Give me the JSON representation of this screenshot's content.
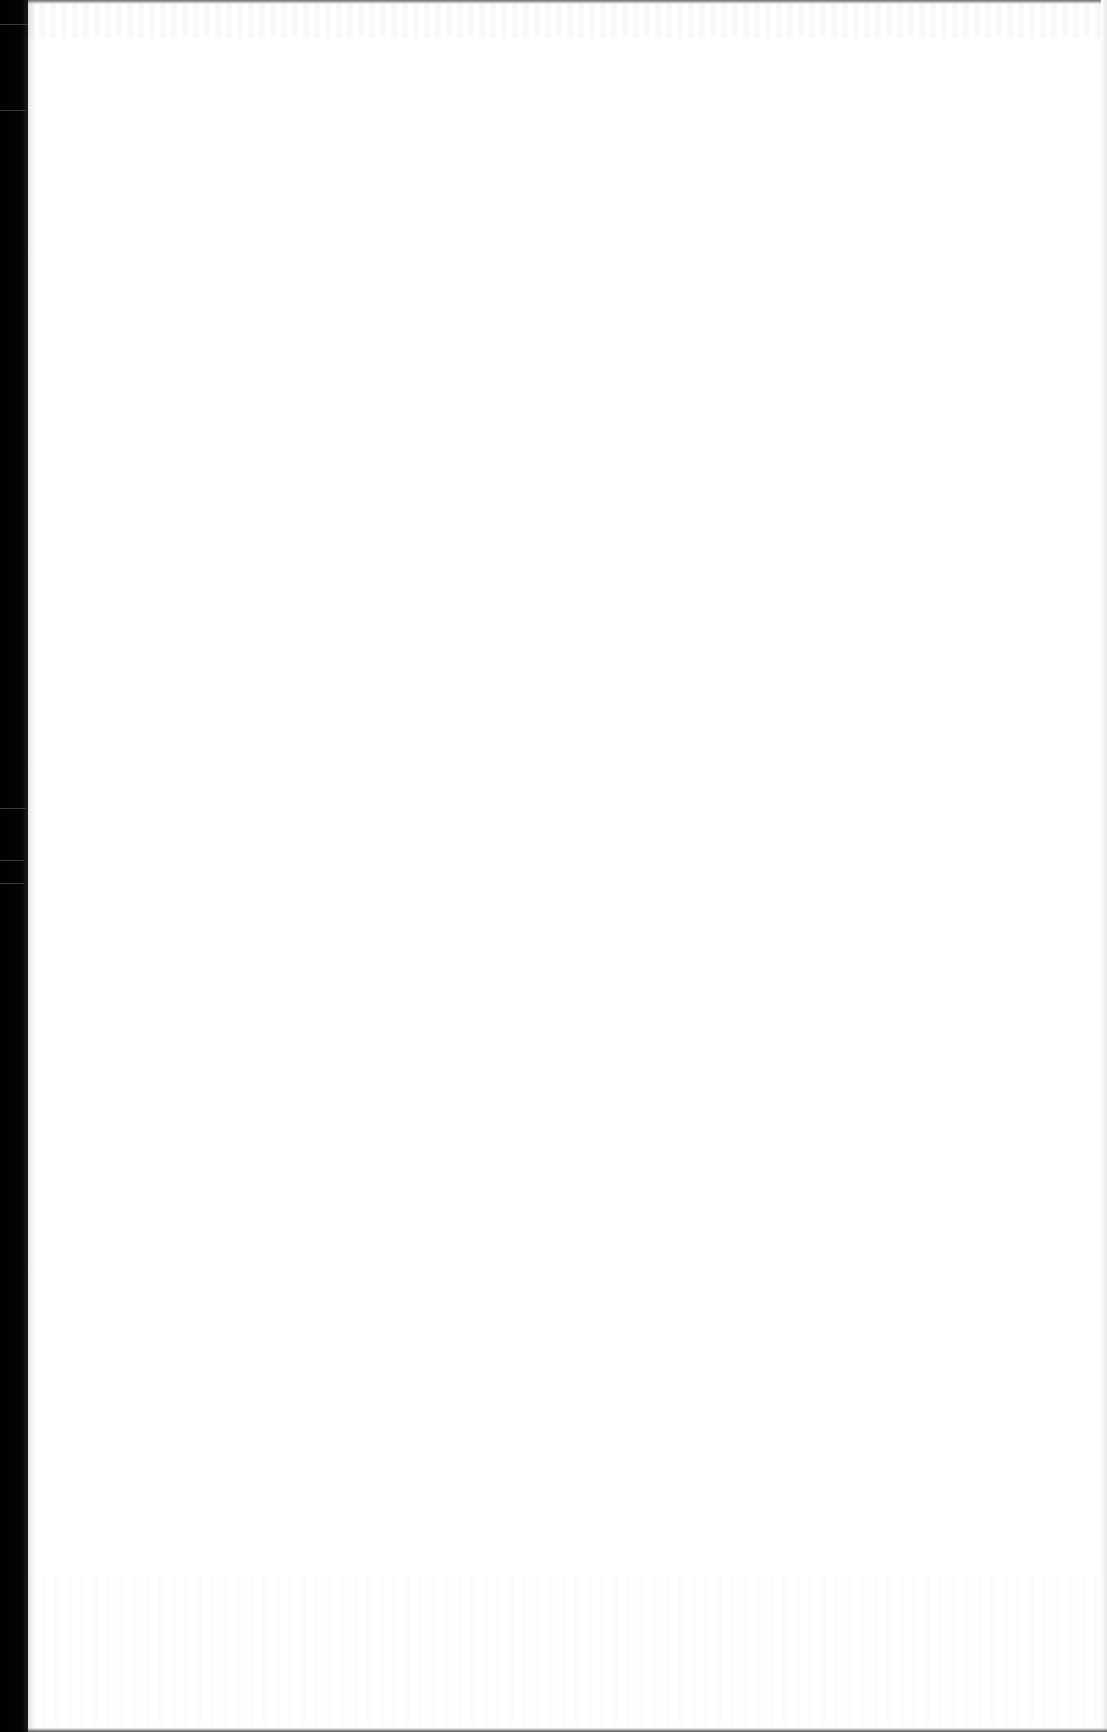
{
  "document": {
    "type": "scanned-page",
    "content_state": "blank",
    "visible_text": "",
    "colors": {
      "paper": "#ffffff",
      "scanner_background": "#000000"
    }
  }
}
